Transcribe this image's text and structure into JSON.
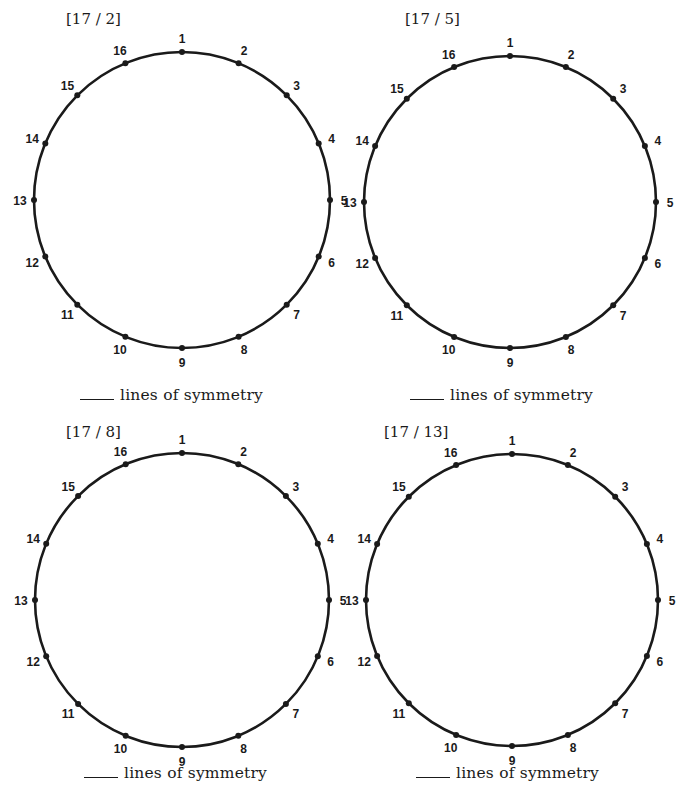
{
  "worksheet": {
    "point_count": 16,
    "colors": {
      "stroke": "#1a1a1a",
      "background": "#ffffff"
    },
    "panels": [
      {
        "title": "[17 / 2]",
        "caption": "lines of symmetry",
        "circle": {
          "cx": 182,
          "cy": 200,
          "r": 148
        },
        "title_pos": {
          "x": 66,
          "y": 10
        },
        "caption_pos": {
          "x": 80,
          "y": 386
        }
      },
      {
        "title": "[17 / 5]",
        "caption": "lines of symmetry",
        "circle": {
          "cx": 510,
          "cy": 202,
          "r": 146
        },
        "title_pos": {
          "x": 405,
          "y": 10
        },
        "caption_pos": {
          "x": 410,
          "y": 386
        }
      },
      {
        "title": "[17 / 8]",
        "caption": "lines of symmetry",
        "circle": {
          "cx": 182,
          "cy": 600,
          "r": 147
        },
        "title_pos": {
          "x": 66,
          "y": 423
        },
        "caption_pos": {
          "x": 84,
          "y": 764
        }
      },
      {
        "title": "[17 / 13]",
        "caption": "lines of symmetry",
        "circle": {
          "cx": 512,
          "cy": 600,
          "r": 146
        },
        "title_pos": {
          "x": 384,
          "y": 423
        },
        "caption_pos": {
          "x": 416,
          "y": 764
        }
      }
    ],
    "point_labels": [
      "1",
      "2",
      "3",
      "4",
      "5",
      "6",
      "7",
      "8",
      "9",
      "10",
      "11",
      "12",
      "13",
      "14",
      "15",
      "16"
    ]
  }
}
